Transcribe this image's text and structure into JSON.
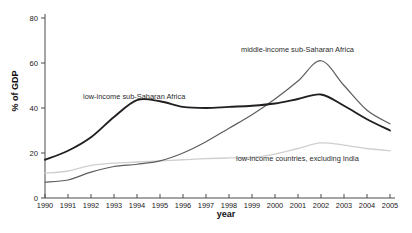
{
  "chart_data": {
    "type": "line",
    "title": "",
    "xlabel": "year",
    "ylabel": "% of GDP",
    "xlim": [
      1990,
      2005
    ],
    "ylim": [
      0,
      80
    ],
    "grid": false,
    "legend_position": "inline-annotations",
    "x": [
      1990,
      1991,
      1992,
      1993,
      1994,
      1995,
      1996,
      1997,
      1998,
      1999,
      2000,
      2001,
      2002,
      2003,
      2004,
      2005
    ],
    "xticklabels": [
      "1990",
      "1991",
      "1992",
      "1993",
      "1994",
      "1995",
      "1996",
      "1997",
      "1998",
      "1999",
      "2000",
      "2001",
      "2002",
      "2003",
      "2004",
      "2005"
    ],
    "yticks": [
      0,
      20,
      40,
      60,
      80
    ],
    "yticklabels": [
      "0",
      "20",
      "40",
      "60",
      "80"
    ],
    "series": [
      {
        "name": "low-income sub-Saharan Africa",
        "color": "#231f20",
        "width": 1.9,
        "values": [
          17,
          21,
          27,
          36,
          43.5,
          43,
          40.5,
          40,
          40.5,
          41,
          42,
          44,
          46,
          41,
          35,
          30
        ]
      },
      {
        "name": "middle-income sub-Saharan Africa",
        "color": "#5d5d5d",
        "width": 1.2,
        "values": [
          7,
          8,
          11.5,
          14,
          15,
          16.5,
          20,
          25,
          31,
          37,
          44,
          52,
          61,
          50,
          39,
          33
        ]
      },
      {
        "name": "low-income countries, excluding India",
        "color": "#cfcfcf",
        "width": 1.3,
        "values": [
          11,
          12,
          14.5,
          15.5,
          16,
          16.5,
          17,
          17.5,
          17.8,
          18,
          19.5,
          22,
          24.5,
          23.5,
          22,
          21
        ]
      }
    ],
    "annotations": [
      {
        "text": "low-income sub-Saharan Africa",
        "x_px": 83,
        "y_px": 99,
        "anchor": "start"
      },
      {
        "text": "middle-income sub-Saharan Africa",
        "x_px": 241,
        "y_px": 52,
        "anchor": "start"
      },
      {
        "text": "low-income countries, excluding India",
        "x_px": 236,
        "y_px": 161,
        "anchor": "start"
      }
    ]
  },
  "footer": {
    "source_note": ""
  }
}
